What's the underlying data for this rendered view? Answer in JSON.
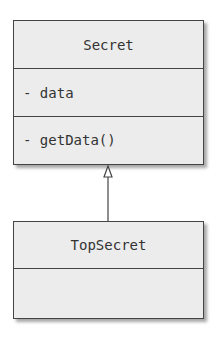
{
  "classes": [
    {
      "name": "Secret",
      "attributes": [
        "- data"
      ],
      "operations": [
        "- getData()"
      ]
    },
    {
      "name": "TopSecret",
      "attributes": [],
      "operations": []
    }
  ],
  "relationships": [
    {
      "type": "generalization",
      "from": "TopSecret",
      "to": "Secret"
    }
  ]
}
